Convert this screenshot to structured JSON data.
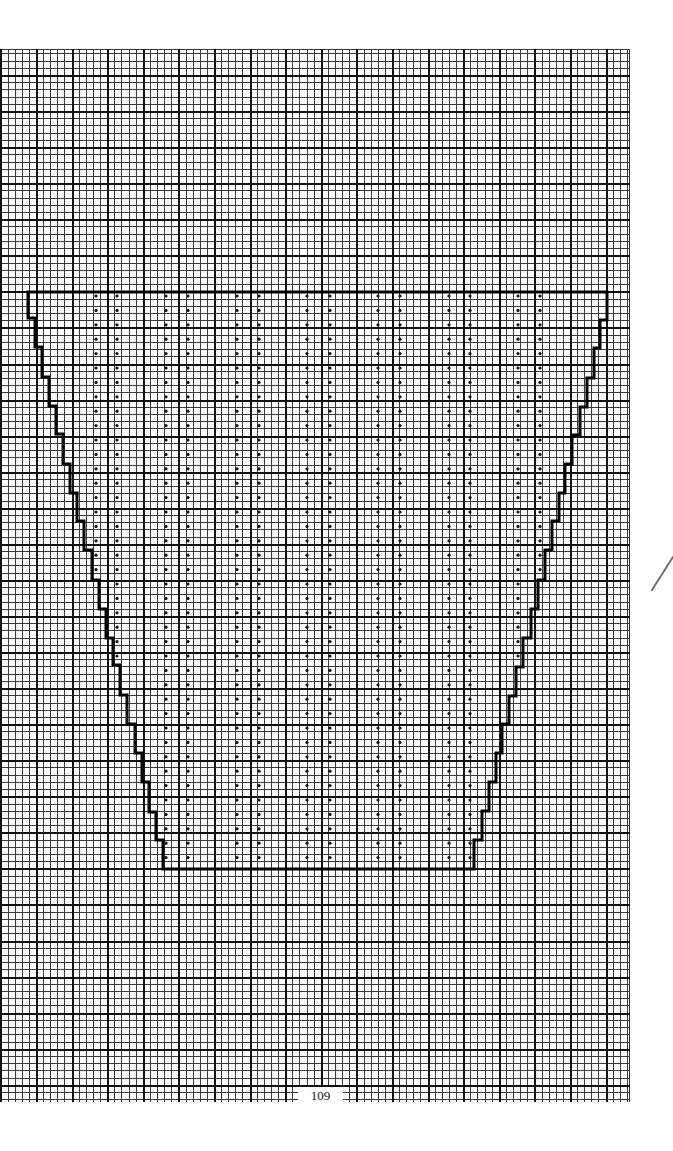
{
  "page": {
    "width": 673,
    "height": 1151,
    "background": "#ffffff",
    "page_number": "109"
  },
  "grid": {
    "left": 0,
    "top": 49,
    "right": 630,
    "bottom": 1102,
    "minor_spacing_x": 7.12,
    "minor_spacing_y": 7.213,
    "major_origin_x": 36,
    "major_origin_y": 75,
    "major_every": 5,
    "minor_color": "#3a3a3a",
    "major_color": "#111111",
    "minor_width": 1,
    "major_width": 2
  },
  "chart_data": {
    "type": "diagram",
    "title": "",
    "outline": {
      "color": "#000000",
      "stroke_width": 3,
      "points": [
        [
          28,
          292
        ],
        [
          28,
          318
        ],
        [
          35,
          318
        ],
        [
          35,
          347
        ],
        [
          42,
          347
        ],
        [
          42,
          377
        ],
        [
          49,
          377
        ],
        [
          49,
          406
        ],
        [
          56,
          406
        ],
        [
          56,
          434
        ],
        [
          63,
          434
        ],
        [
          63,
          464
        ],
        [
          70,
          464
        ],
        [
          70,
          493
        ],
        [
          77,
          493
        ],
        [
          77,
          521
        ],
        [
          84,
          521
        ],
        [
          84,
          550
        ],
        [
          92,
          550
        ],
        [
          92,
          580
        ],
        [
          99,
          580
        ],
        [
          99,
          609
        ],
        [
          106,
          609
        ],
        [
          106,
          638
        ],
        [
          113,
          638
        ],
        [
          113,
          665
        ],
        [
          120,
          665
        ],
        [
          120,
          695
        ],
        [
          127,
          695
        ],
        [
          127,
          724
        ],
        [
          135,
          724
        ],
        [
          135,
          753
        ],
        [
          142,
          753
        ],
        [
          142,
          782
        ],
        [
          149,
          782
        ],
        [
          149,
          812
        ],
        [
          156,
          812
        ],
        [
          156,
          840
        ],
        [
          163,
          840
        ],
        [
          163,
          869
        ],
        [
          474,
          869
        ],
        [
          474,
          840
        ],
        [
          482,
          840
        ],
        [
          482,
          811
        ],
        [
          489,
          811
        ],
        [
          489,
          782
        ],
        [
          496,
          782
        ],
        [
          496,
          753
        ],
        [
          502,
          753
        ],
        [
          502,
          724
        ],
        [
          509,
          724
        ],
        [
          509,
          696
        ],
        [
          516,
          696
        ],
        [
          516,
          667
        ],
        [
          523,
          667
        ],
        [
          523,
          638
        ],
        [
          531,
          638
        ],
        [
          531,
          609
        ],
        [
          538,
          609
        ],
        [
          538,
          580
        ],
        [
          545,
          580
        ],
        [
          545,
          550
        ],
        [
          552,
          550
        ],
        [
          552,
          521
        ],
        [
          559,
          521
        ],
        [
          559,
          493
        ],
        [
          565,
          493
        ],
        [
          565,
          464
        ],
        [
          572,
          464
        ],
        [
          572,
          435
        ],
        [
          580,
          435
        ],
        [
          580,
          407
        ],
        [
          587,
          407
        ],
        [
          587,
          378
        ],
        [
          594,
          378
        ],
        [
          594,
          348
        ],
        [
          600,
          348
        ],
        [
          600,
          320
        ],
        [
          607,
          320
        ],
        [
          607,
          292
        ]
      ]
    },
    "dots": {
      "color": "#111111",
      "radius": 1.6,
      "row_start_y": 296,
      "row_spacing": 14.4,
      "columns": [
        {
          "x": 96,
          "rows": 20
        },
        {
          "x": 117,
          "rows": 26
        },
        {
          "x": 166,
          "rows": 40
        },
        {
          "x": 188,
          "rows": 40
        },
        {
          "x": 237,
          "rows": 40
        },
        {
          "x": 259,
          "rows": 40
        },
        {
          "x": 307,
          "rows": 40
        },
        {
          "x": 330,
          "rows": 40
        },
        {
          "x": 378,
          "rows": 40
        },
        {
          "x": 400,
          "rows": 40
        },
        {
          "x": 449,
          "rows": 40
        },
        {
          "x": 470,
          "rows": 40
        },
        {
          "x": 518,
          "rows": 26
        },
        {
          "x": 540,
          "rows": 20
        }
      ]
    }
  },
  "annotations": {
    "pencil_mark": {
      "x1": 652,
      "y1": 590,
      "x2": 673,
      "y2": 557,
      "color": "#6e6e6e",
      "width": 2
    },
    "page_number_box": {
      "x": 298,
      "y": 1087,
      "w": 45,
      "h": 16
    }
  }
}
